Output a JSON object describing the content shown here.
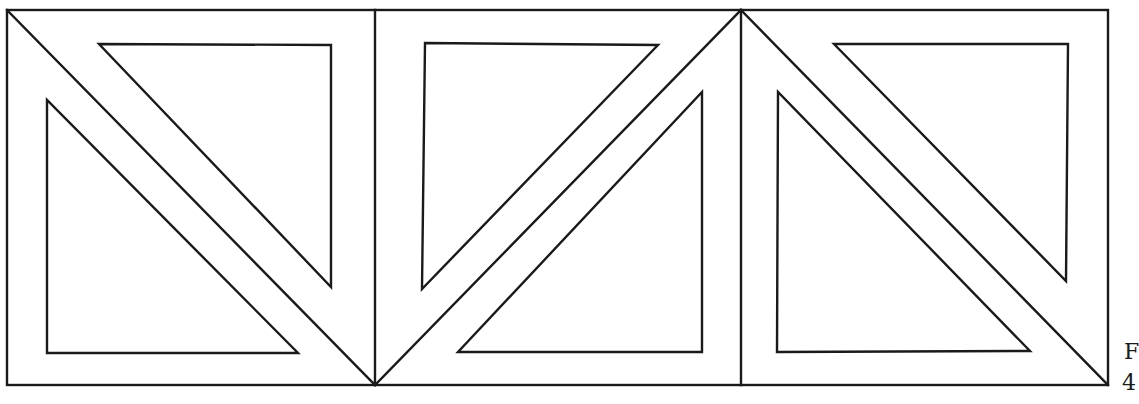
{
  "figure": {
    "stroke_color": "#1a1a1a",
    "background_color": "#ffffff",
    "caption_line1": "F",
    "caption_line2": "4"
  },
  "frame": {
    "x1": 7,
    "y1": 10,
    "x2": 1108,
    "y2": 385
  },
  "dividers": [
    {
      "x1": 375,
      "y1": 10,
      "x2": 375,
      "y2": 385
    },
    {
      "x1": 741,
      "y1": 10,
      "x2": 741,
      "y2": 385
    }
  ],
  "diagonals": [
    {
      "x1": 7,
      "y1": 10,
      "x2": 375,
      "y2": 385
    },
    {
      "x1": 375,
      "y1": 385,
      "x2": 741,
      "y2": 10
    },
    {
      "x1": 741,
      "y1": 10,
      "x2": 1108,
      "y2": 385
    }
  ],
  "inner_triangles": [
    {
      "points": "99,44 331,45 331,287"
    },
    {
      "points": "47,100 47,353 298,353"
    },
    {
      "points": "425,43 658,45 422,289"
    },
    {
      "points": "702,92 702,352 458,352"
    },
    {
      "points": "834,44 1068,44 1066,281"
    },
    {
      "points": "778,92 777,352 1030,351"
    }
  ]
}
